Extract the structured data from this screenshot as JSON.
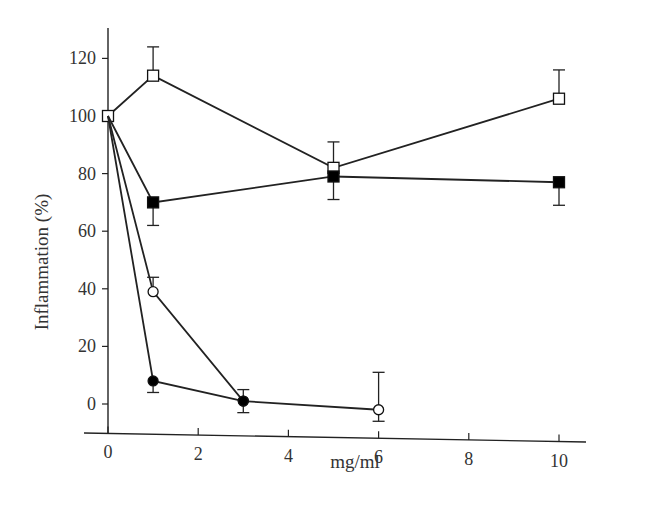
{
  "chart_data": {
    "type": "line",
    "title": "",
    "xlabel": "mg/ml",
    "ylabel": "Inflammation (%)",
    "xlim": [
      0,
      10.5
    ],
    "ylim": [
      -10,
      130
    ],
    "x_ticks": [
      0,
      2,
      4,
      6,
      8,
      10
    ],
    "y_ticks": [
      0,
      20,
      40,
      60,
      80,
      100,
      120
    ],
    "grid": false,
    "legend": "none",
    "series": [
      {
        "name": "open-square",
        "marker": "square-open",
        "x": [
          0,
          1,
          5,
          10
        ],
        "y": [
          100,
          114,
          82,
          106
        ],
        "err_up": [
          0,
          10,
          9,
          10
        ],
        "err_down": [
          0,
          0,
          0,
          0
        ]
      },
      {
        "name": "filled-square",
        "marker": "square-filled",
        "x": [
          0,
          1,
          5,
          10
        ],
        "y": [
          100,
          70,
          79,
          77
        ],
        "err_up": [
          0,
          0,
          0,
          0
        ],
        "err_down": [
          0,
          8,
          8,
          8
        ]
      },
      {
        "name": "open-circle",
        "marker": "circle-open",
        "x": [
          0,
          1,
          3,
          6
        ],
        "y": [
          100,
          39,
          1,
          -2
        ],
        "err_up": [
          0,
          5,
          4,
          13
        ],
        "err_down": [
          0,
          0,
          4,
          4
        ]
      },
      {
        "name": "filled-circle",
        "marker": "circle-filled",
        "x": [
          0,
          1,
          3
        ],
        "y": [
          100,
          8,
          1
        ],
        "err_up": [
          0,
          0,
          0
        ],
        "err_down": [
          0,
          4,
          0
        ]
      }
    ]
  }
}
